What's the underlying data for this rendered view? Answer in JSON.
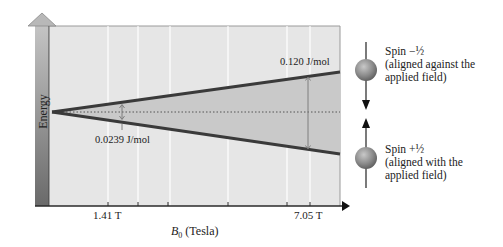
{
  "diagram": {
    "y_axis_label": "Energy",
    "x_axis_label": "B₀ (Tesla)",
    "x_axis_label_base": "B",
    "x_axis_label_sub": "0",
    "x_axis_label_unit": "(Tesla)",
    "ticks": [
      {
        "label": "1.41 T",
        "x": 108
      },
      {
        "label": "7.05 T",
        "x": 310
      }
    ],
    "annotations": {
      "small_gap": "0.0239 J/mol",
      "large_gap": "0.120 J/mol"
    },
    "spin_states": [
      {
        "label": "Spin −½",
        "desc_line1": "(aligned against the",
        "desc_line2": "applied field)",
        "direction": "down"
      },
      {
        "label": "Spin +½",
        "desc_line1": "(aligned with the",
        "desc_line2": "applied field)",
        "direction": "up"
      }
    ],
    "colors": {
      "plot_bg": "#e6e6e6",
      "wedge_fill": "#c9c9c9",
      "line": "#3a3a3a",
      "energy_bar_top": "#bdbdbd",
      "energy_bar_bottom": "#6e6e6e",
      "sphere": "#8a8a8a"
    }
  }
}
